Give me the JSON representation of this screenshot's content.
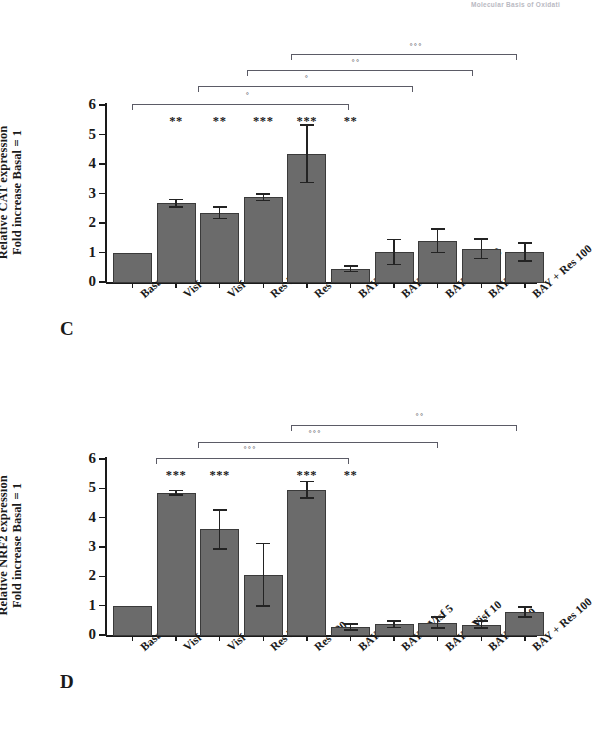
{
  "page_header": "Molecular Basis of Oxidati",
  "panels": [
    {
      "letter": "C",
      "y_title_line1": "Relative CAT expression",
      "y_title_line2": "Fold increase Basal = 1"
    },
    {
      "letter": "D",
      "y_title_line1": "Relative NRF2 expression",
      "y_title_line2": "Fold increase Basal = 1"
    }
  ],
  "chart_data": [
    {
      "type": "bar",
      "panel": "C",
      "title": "",
      "xlabel": "",
      "ylabel": "Relative CAT expression Fold increase Basal = 1",
      "ylim": [
        0,
        6
      ],
      "yticks": [
        0,
        1,
        2,
        3,
        4,
        5,
        6
      ],
      "grid": false,
      "legend": "none",
      "categories": [
        "Basal",
        "Visf 5",
        "Visf 10",
        "Res 50",
        "Res 100",
        "BAY",
        "BAY + Visf 5",
        "BAY + Visf 10",
        "BAY Res 50",
        "BAY + Res 100"
      ],
      "values": [
        1.0,
        2.67,
        2.35,
        2.87,
        4.35,
        0.45,
        1.02,
        1.4,
        1.12,
        1.02
      ],
      "errors": [
        0.0,
        0.12,
        0.2,
        0.11,
        0.98,
        0.1,
        0.42,
        0.4,
        0.33,
        0.3
      ],
      "significance": [
        "",
        "**",
        "**",
        "***",
        "***",
        "**",
        "",
        "",
        "",
        ""
      ],
      "comparison_brackets": [
        {
          "symbol": "°",
          "from": "Visf 5",
          "to": "BAY + Visf 5"
        },
        {
          "symbol": "°",
          "from": "Visf 10",
          "to": "BAY + Visf 10"
        },
        {
          "symbol": "°°",
          "from": "Res 50",
          "to": "BAY Res 50"
        },
        {
          "symbol": "°°°",
          "from": "Res 100",
          "to": "BAY + Res 100"
        }
      ]
    },
    {
      "type": "bar",
      "panel": "D",
      "title": "",
      "xlabel": "",
      "ylabel": "Relative NRF2 expression Fold increase Basal = 1",
      "ylim": [
        0,
        6
      ],
      "yticks": [
        0,
        1,
        2,
        3,
        4,
        5,
        6
      ],
      "grid": false,
      "legend": "none",
      "categories": [
        "Basal",
        "Visf 5",
        "Visf 10",
        "Res 50",
        "Res 100",
        "BAY",
        "BAY + Visf 5",
        "BAY + Visf 10",
        "BAY Res 50",
        "BAY + Res 100"
      ],
      "values": [
        1.0,
        4.85,
        3.6,
        2.05,
        4.95,
        0.28,
        0.36,
        0.42,
        0.35,
        0.78
      ],
      "errors": [
        0.0,
        0.07,
        0.67,
        1.07,
        0.28,
        0.1,
        0.11,
        0.19,
        0.12,
        0.17
      ],
      "significance": [
        "",
        "***",
        "***",
        "",
        "***",
        "**",
        "",
        "",
        "",
        ""
      ],
      "comparison_brackets": [
        {
          "symbol": "°°°",
          "from": "Visf 5",
          "to": "BAY + Visf 5"
        },
        {
          "symbol": "°°°",
          "from": "Visf 10",
          "to": "BAY + Visf 10"
        },
        {
          "symbol": "°°",
          "from": "Res 100",
          "to": "BAY + Res 100"
        }
      ]
    }
  ],
  "colors": {
    "bar_fill": "#6b6b6b",
    "bar_stroke": "#3a3a3a",
    "axis": "#1a1a1a",
    "bracket": "#5b5b66"
  }
}
